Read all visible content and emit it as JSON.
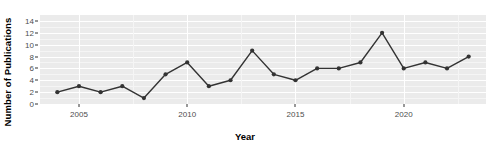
{
  "chart_data": {
    "type": "line",
    "title": "",
    "xlabel": "Year",
    "ylabel": "Number of Publications",
    "x": [
      2004,
      2005,
      2006,
      2007,
      2008,
      2009,
      2010,
      2011,
      2012,
      2013,
      2014,
      2015,
      2016,
      2017,
      2018,
      2019,
      2020,
      2021,
      2022,
      2023
    ],
    "values": [
      2,
      3,
      2,
      3,
      1,
      5,
      7,
      3,
      4,
      9,
      5,
      4,
      6,
      6,
      7,
      12,
      6,
      7,
      6,
      8
    ],
    "series": [
      {
        "name": "Number of Publications",
        "values": [
          2,
          3,
          2,
          3,
          1,
          5,
          7,
          3,
          4,
          9,
          5,
          4,
          6,
          6,
          7,
          12,
          6,
          7,
          6,
          8
        ]
      }
    ],
    "xlim": [
      2003.2,
      2023.8
    ],
    "ylim": [
      0,
      15
    ],
    "x_ticks": [
      2005,
      2010,
      2015,
      2020
    ],
    "x_tick_labels": [
      "2005",
      "2010",
      "2015",
      "2020"
    ],
    "y_ticks": [
      0,
      2,
      4,
      6,
      8,
      10,
      12,
      14
    ],
    "y_tick_labels": [
      "0",
      "2",
      "4",
      "6",
      "8",
      "10",
      "12",
      "14"
    ],
    "grid": true,
    "legend": "none",
    "line_color": "#333333",
    "marker_color": "#333333",
    "panel_background": "#ebebeb",
    "gridline_color": "#ffffff",
    "plot_background": "#ffffff"
  }
}
